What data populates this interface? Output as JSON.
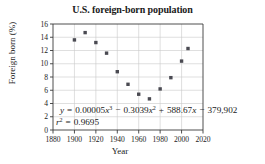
{
  "chart_data": {
    "type": "scatter",
    "title": "U.S. foreign-born population",
    "xlabel": "Year",
    "ylabel": "Foreign born (%)",
    "xlim": [
      1880,
      2020
    ],
    "ylim": [
      0,
      16
    ],
    "xticks": [
      "1880",
      "1900",
      "1920",
      "1940",
      "1960",
      "1980",
      "2000",
      "2020"
    ],
    "yticks": [
      "0",
      "2",
      "4",
      "6",
      "8",
      "10",
      "12",
      "14",
      "16"
    ],
    "grid": true,
    "legend": "none",
    "x": [
      1900,
      1910,
      1920,
      1930,
      1940,
      1950,
      1960,
      1970,
      1980,
      1990,
      2000,
      2006
    ],
    "values": [
      13.6,
      14.7,
      13.2,
      11.6,
      8.8,
      6.9,
      5.4,
      4.7,
      6.2,
      7.9,
      10.4,
      12.3
    ],
    "series": [
      {
        "name": "Foreign born (%)",
        "values": [
          13.6,
          14.7,
          13.2,
          11.6,
          8.8,
          6.9,
          5.4,
          4.7,
          6.2,
          7.9,
          10.4,
          12.3
        ]
      }
    ],
    "fit_curve": {
      "type": "cubic",
      "a": 5e-05,
      "b": -0.3039,
      "c": 588.67,
      "d": -379902
    },
    "annotations": {
      "equation_y": "y",
      "equation_eq": "=",
      "equation_term1_coef": "0.00005",
      "equation_term1_var": "x",
      "equation_term1_exp": "3",
      "equation_op1": "−",
      "equation_term2_coef": "0.3039",
      "equation_term2_var": "x",
      "equation_term2_exp": "2",
      "equation_op2": "+",
      "equation_term3_coef": "588.67",
      "equation_term3_var": "x",
      "equation_op3": "−",
      "equation_term4": "379,902",
      "rsq_var": "r",
      "rsq_exp": "2",
      "rsq_eq": "=",
      "rsq_value": "0.9695"
    },
    "colors": {
      "marker": "#4a4a52",
      "curve": "#4a4a52",
      "grid": "#c9c9c9",
      "axis": "#3a3a3a",
      "background": "#ffffff"
    }
  }
}
